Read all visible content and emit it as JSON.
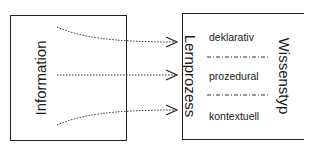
{
  "diagram": {
    "left_box": {
      "label": "Information"
    },
    "process_label": "Lernprozess",
    "right_box": {
      "label": "Wissenstyp",
      "types": [
        "deklarativ",
        "prozedural",
        "kontextuell"
      ]
    },
    "arrows": {
      "count": 3,
      "style": "dotted",
      "from": "Information",
      "to": "Lernprozess"
    },
    "separators": {
      "count": 2,
      "style": "dash-dot"
    },
    "colors": {
      "line": "#222222",
      "background": "#ffffff"
    }
  }
}
